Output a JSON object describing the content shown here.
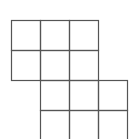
{
  "diagram": {
    "type": "grid-shape",
    "line_color": "#555555",
    "background": "#ffffff",
    "cell_size": 29,
    "blocks": [
      {
        "name": "top-block",
        "x": 11,
        "y": 20,
        "cols": 3,
        "rows": 2
      },
      {
        "name": "bottom-block",
        "x": 40,
        "y": 80,
        "cols": 3,
        "rows": 2
      }
    ]
  }
}
